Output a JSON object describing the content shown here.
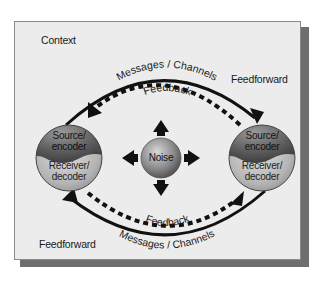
{
  "diagram": {
    "context_label": "Context",
    "feedforward_top": "Feedforward",
    "feedforward_bottom": "Feedforward",
    "messages_top": "Messages / Channels",
    "messages_bottom": "Messages / Channels",
    "feedback_top": "Feedback",
    "feedback_bottom": "Feedback",
    "noise": "Noise",
    "left_node": {
      "top": "Source/",
      "top2": "encoder",
      "bottom": "Receiver/",
      "bottom2": "decoder"
    },
    "right_node": {
      "top": "Source/",
      "top2": "encoder",
      "bottom": "Receiver/",
      "bottom2": "decoder"
    },
    "colors": {
      "frame_bg": "#ececec",
      "shadow": "#6e6e6e",
      "sphere_dark": "#6a6a6a",
      "sphere_light": "#c8c8c8",
      "arrow": "#111111"
    }
  }
}
